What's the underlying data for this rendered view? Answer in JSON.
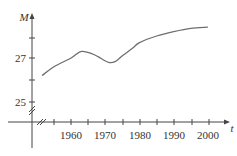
{
  "chart_data": {
    "type": "line",
    "title": "",
    "xlabel": "t",
    "ylabel": "M",
    "x_ticks": [
      1955,
      1960,
      1965,
      1970,
      1975,
      1980,
      1985,
      1990,
      1995,
      2000
    ],
    "x_tick_labels": [
      "1960",
      "1970",
      "1980",
      "1990",
      "2000"
    ],
    "y_ticks": [
      25,
      26,
      27,
      28
    ],
    "y_tick_labels": [
      "25",
      "27"
    ],
    "xlim": [
      1940,
      2006
    ],
    "ylim": [
      24,
      29
    ],
    "axis_breaks": [
      "x",
      "y"
    ],
    "grid": false,
    "legend": null,
    "series": [
      {
        "name": "M",
        "x": [
          1951.5,
          1955,
          1960,
          1963,
          1966,
          1968,
          1971,
          1973,
          1975,
          1978,
          1980,
          1985,
          1990,
          1995,
          2000
        ],
        "values": [
          26.2,
          26.6,
          27.0,
          27.3,
          27.2,
          27.05,
          26.8,
          26.85,
          27.1,
          27.45,
          27.7,
          28.0,
          28.2,
          28.35,
          28.4
        ]
      }
    ]
  },
  "labels": {
    "y_axis": "M",
    "x_axis": "t",
    "y27": "27",
    "y25": "25",
    "x1960": "1960",
    "x1970": "1970",
    "x1980": "1980",
    "x1990": "1990",
    "x2000": "2000"
  }
}
